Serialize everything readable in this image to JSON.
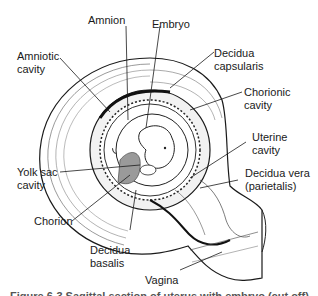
{
  "diagram": {
    "labels": {
      "amnion": "Amnion",
      "embryo": "Embryo",
      "amniotic_cavity_1": "Amniotic",
      "amniotic_cavity_2": "cavity",
      "decidua_capsularis_1": "Decidua",
      "decidua_capsularis_2": "capsularis",
      "chorionic_cavity_1": "Chorionic",
      "chorionic_cavity_2": "cavity",
      "uterine_cavity_1": "Uterine",
      "uterine_cavity_2": "cavity",
      "decidua_vera_1": "Decidua vera",
      "decidua_vera_2": "(parietalis)",
      "yolk_sac_cavity_1": "Yolk sac",
      "yolk_sac_cavity_2": "cavity",
      "chorion": "Chorion",
      "decidua_basalis_1": "Decidua",
      "decidua_basalis_2": "basalis",
      "vagina": "Vagina"
    },
    "caption": "Figure 6-3 Sagittal section of uterus with embryo (cut off)",
    "colors": {
      "line": "#1a1a1a",
      "shade": "#9a9a9a",
      "background": "#ffffff"
    }
  }
}
